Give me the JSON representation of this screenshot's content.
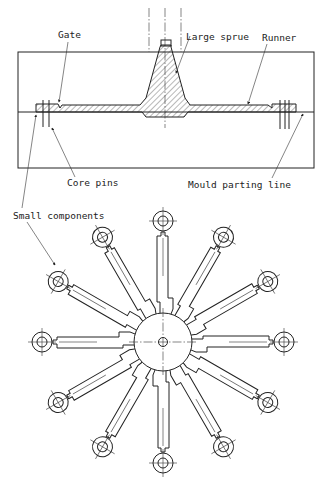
{
  "diagram": {
    "section_view": {
      "labels": {
        "gate": "Gate",
        "large_sprue": "Large sprue",
        "runner": "Runner",
        "core_pins": "Core pins",
        "mould_parting_line": "Mould parting line"
      }
    },
    "plan_view": {
      "labels": {
        "small_components": "Small components"
      },
      "cavity_count": 12,
      "spoke_angle_step_deg": 30
    },
    "colors": {
      "line": "#222222",
      "background": "#ffffff"
    }
  }
}
